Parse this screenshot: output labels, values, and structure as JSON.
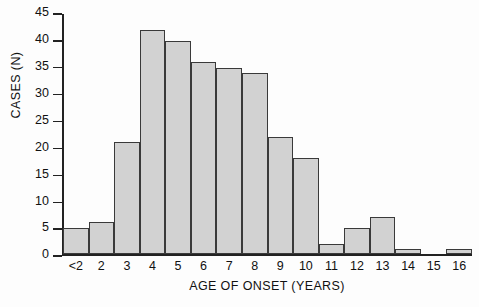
{
  "chart_data": {
    "type": "bar",
    "title": "",
    "xlabel": "AGE OF ONSET (YEARS)",
    "ylabel": "CASES (N)",
    "categories": [
      "<2",
      "2",
      "3",
      "4",
      "5",
      "6",
      "7",
      "8",
      "9",
      "10",
      "11",
      "12",
      "13",
      "14",
      "15",
      "16"
    ],
    "values": [
      5,
      6,
      21,
      42,
      40,
      36,
      35,
      34,
      22,
      18,
      2,
      5,
      7,
      1,
      0,
      1
    ],
    "ylim": [
      0,
      45
    ],
    "yticks": [
      0,
      5,
      10,
      15,
      20,
      25,
      30,
      35,
      40,
      45
    ],
    "ytick_labels": [
      "0",
      "5",
      "10",
      "15",
      "20",
      "25",
      "30",
      "35",
      "40",
      "45"
    ],
    "grid": false,
    "legend": null,
    "bar_style": {
      "fill": "#d2d2d2",
      "edge": "#3a3a3a",
      "contiguous": true
    },
    "background": "#fdfdfd",
    "axis_color": "#222222"
  }
}
